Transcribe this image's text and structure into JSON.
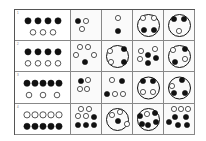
{
  "figure": {
    "rows": [
      {
        "label": "1",
        "stem": {
          "top_filled": 4,
          "bottom_hollow": 3
        },
        "options": [
          {
            "big_circle": false,
            "dots": [
              [
                7,
                11,
                1
              ],
              [
                15,
                11,
                0
              ],
              [
                11,
                19,
                0
              ]
            ]
          },
          {
            "big_circle": false,
            "dots": [
              [
                16,
                8,
                0
              ],
              [
                16,
                21,
                1
              ]
            ]
          },
          {
            "big_circle": true,
            "dots": [
              [
                10,
                8,
                0
              ],
              [
                21,
                8,
                0
              ],
              [
                11,
                20,
                1
              ],
              [
                21,
                20,
                1
              ]
            ]
          },
          {
            "big_circle": true,
            "dots": [
              [
                10,
                9,
                1
              ],
              [
                20,
                9,
                1
              ],
              [
                15,
                21,
                0
              ]
            ]
          }
        ]
      },
      {
        "label": "2",
        "stem": {
          "top_filled": 4,
          "bottom_hollow": 4
        },
        "options": [
          {
            "big_circle": false,
            "dots": [
              [
                9,
                6,
                0
              ],
              [
                17,
                6,
                0
              ],
              [
                5,
                14,
                0
              ],
              [
                23,
                14,
                0
              ],
              [
                14,
                21,
                1
              ]
            ]
          },
          {
            "big_circle": true,
            "dots": [
              [
                8,
                10,
                0
              ],
              [
                22,
                8,
                1
              ],
              [
                9,
                21,
                0
              ],
              [
                22,
                21,
                1
              ]
            ]
          },
          {
            "big_circle": false,
            "dots": [
              [
                8,
                10,
                0
              ],
              [
                22,
                8,
                0
              ],
              [
                7,
                18,
                0
              ],
              [
                15,
                14,
                1
              ],
              [
                15,
                22,
                1
              ],
              [
                23,
                17,
                1
              ]
            ]
          },
          {
            "big_circle": true,
            "dots": [
              [
                9,
                9,
                0
              ],
              [
                21,
                8,
                1
              ],
              [
                21,
                18,
                0
              ],
              [
                11,
                21,
                1
              ]
            ]
          }
        ]
      },
      {
        "label": "3",
        "stem": {
          "top_filled": 5,
          "bottom_hollow": 3
        },
        "options": [
          {
            "big_circle": false,
            "dots": [
              [
                10,
                9,
                1
              ],
              [
                17,
                8,
                0
              ],
              [
                9,
                17,
                0
              ],
              [
                16,
                17,
                0
              ]
            ]
          },
          {
            "big_circle": false,
            "dots": [
              [
                10,
                8,
                0
              ],
              [
                20,
                9,
                1
              ],
              [
                5,
                22,
                1
              ],
              [
                13,
                22,
                0
              ],
              [
                21,
                22,
                0
              ]
            ]
          },
          {
            "big_circle": true,
            "dots": [
              [
                10,
                9,
                1
              ],
              [
                20,
                9,
                1
              ],
              [
                10,
                20,
                0
              ],
              [
                20,
                20,
                0
              ]
            ]
          },
          {
            "big_circle": true,
            "dots": [
              [
                18,
                8,
                1
              ],
              [
                8,
                14,
                0
              ],
              [
                10,
                21,
                1
              ],
              [
                21,
                21,
                1
              ]
            ]
          }
        ]
      },
      {
        "label": "4",
        "stem": {
          "top_hollow": 5,
          "bottom_filled": 5
        },
        "options": [
          {
            "big_circle": false,
            "dots": [
              [
                10,
                5,
                0
              ],
              [
                18,
                5,
                0
              ],
              [
                7,
                12,
                0
              ],
              [
                15,
                12,
                0
              ],
              [
                23,
                13,
                1
              ],
              [
                7,
                21,
                1
              ],
              [
                15,
                21,
                1
              ],
              [
                23,
                21,
                1
              ]
            ]
          },
          {
            "big_circle": true,
            "dots": [
              [
                10,
                11,
                0
              ],
              [
                18,
                8,
                0
              ],
              [
                16,
                17,
                1
              ],
              [
                25,
                20,
                0
              ]
            ]
          },
          {
            "big_circle": true,
            "dots": [
              [
                7,
                12,
                1
              ],
              [
                14,
                10,
                0
              ],
              [
                22,
                9,
                1
              ],
              [
                9,
                20,
                1
              ],
              [
                15,
                21,
                1
              ],
              [
                23,
                18,
                1
              ]
            ]
          },
          {
            "big_circle": false,
            "dots": [
              [
                10,
                5,
                0
              ],
              [
                17,
                5,
                0
              ],
              [
                24,
                5,
                0
              ],
              [
                11,
                13,
                1
              ],
              [
                22,
                13,
                1
              ],
              [
                5,
                18,
                1
              ],
              [
                14,
                21,
                1
              ],
              [
                23,
                21,
                1
              ]
            ]
          }
        ]
      }
    ]
  },
  "colors": {
    "ink": "#111111",
    "grid": "#888888",
    "frame": "#555555",
    "cell_bg": "#fafafa"
  }
}
